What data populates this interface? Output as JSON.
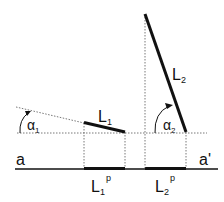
{
  "diagram": {
    "baseline": {
      "left_label": "a",
      "right_label": "a'"
    },
    "segment1": {
      "label": "L",
      "sub": "1",
      "angle_label": "α",
      "angle_sub": "1"
    },
    "segment2": {
      "label": "L",
      "sub": "2",
      "angle_label": "α",
      "angle_sub": "2"
    },
    "projection1": {
      "label": "L",
      "sub": "1",
      "sup": "p"
    },
    "projection2": {
      "label": "L",
      "sub": "2",
      "sup": "p"
    },
    "colors": {
      "line": "#111111",
      "dashed": "#555555"
    }
  }
}
